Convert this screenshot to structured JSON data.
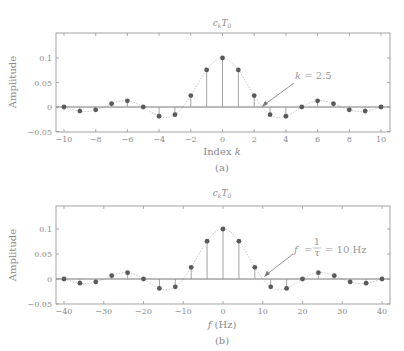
{
  "chart_data": [
    {
      "type": "stem",
      "title": "c_k T_0",
      "xlabel": "Index k",
      "ylabel": "Amplitude",
      "caption": "(a)",
      "xlim": [
        -10.5,
        10.5
      ],
      "ylim": [
        -0.05,
        0.15
      ],
      "xticks": [
        -10,
        -8,
        -6,
        -4,
        -2,
        0,
        2,
        4,
        6,
        8,
        10
      ],
      "xtick_labels": [
        "−10",
        "−8",
        "−6",
        "−4",
        "−2",
        "0",
        "2",
        "4",
        "6",
        "8",
        "10"
      ],
      "yticks": [
        -0.05,
        0,
        0.05,
        0.1
      ],
      "ytick_labels": [
        "−0.05",
        "0",
        "0.05",
        "0.1"
      ],
      "grid": false,
      "x": [
        -10,
        -9,
        -8,
        -7,
        -6,
        -5,
        -4,
        -3,
        -2,
        -1,
        0,
        1,
        2,
        3,
        4,
        5,
        6,
        7,
        8,
        9,
        10
      ],
      "values": [
        0.0,
        -0.0084,
        -0.0058,
        0.0067,
        0.0126,
        0.0,
        -0.0189,
        -0.0156,
        0.0234,
        0.0757,
        0.1,
        0.0757,
        0.0234,
        -0.0156,
        -0.0189,
        0.0,
        0.0126,
        0.0067,
        -0.0058,
        -0.0084,
        0.0
      ],
      "envelope": "0.1·sinc(k/2.5), dotted",
      "annotation": {
        "text": "k = 2.5",
        "x": 2.5,
        "y": 0
      }
    },
    {
      "type": "stem",
      "title": "c_k T_0",
      "xlabel": "f (Hz)",
      "ylabel": "Amplitude",
      "caption": "(b)",
      "xlim": [
        -42,
        42
      ],
      "ylim": [
        -0.05,
        0.15
      ],
      "xticks": [
        -40,
        -30,
        -20,
        -10,
        0,
        10,
        20,
        30,
        40
      ],
      "xtick_labels": [
        "−40",
        "−30",
        "−20",
        "−10",
        "0",
        "10",
        "20",
        "30",
        "40"
      ],
      "yticks": [
        -0.05,
        0,
        0.05,
        0.1
      ],
      "ytick_labels": [
        "−0.05",
        "0",
        "0.05",
        "0.1"
      ],
      "grid": false,
      "x": [
        -40,
        -36,
        -32,
        -28,
        -24,
        -20,
        -16,
        -12,
        -8,
        -4,
        0,
        4,
        8,
        12,
        16,
        20,
        24,
        28,
        32,
        36,
        40
      ],
      "values": [
        0.0,
        -0.0084,
        -0.0058,
        0.0067,
        0.0126,
        0.0,
        -0.0189,
        -0.0156,
        0.0234,
        0.0757,
        0.1,
        0.0757,
        0.0234,
        -0.0156,
        -0.0189,
        0.0,
        0.0126,
        0.0067,
        -0.0058,
        -0.0084,
        0.0
      ],
      "envelope": "0.1·sinc(f/10), dotted",
      "annotation": {
        "text": "f = 1/τ = 10 Hz",
        "x": 10,
        "y": 0
      }
    }
  ],
  "plots": {
    "a": {
      "title_main": "c",
      "title_sub": "k",
      "title_main2": "T",
      "title_sub2": "0",
      "xlabel_text": "Index ",
      "xlabel_var": "k",
      "ylabel": "Amplitude",
      "caption": "(a)",
      "annot_var": "k",
      "annot_rest": " = 2.5"
    },
    "b": {
      "title_main": "c",
      "title_sub": "k",
      "title_main2": "T",
      "title_sub2": "0",
      "xlabel_var": "f",
      "xlabel_text": " (Hz)",
      "ylabel": "Amplitude",
      "caption": "(b)",
      "annot_var": "f",
      "annot_eq": "=",
      "annot_num": "1",
      "annot_den": "τ",
      "annot_rest": "= 10 Hz"
    }
  },
  "colors": {
    "frame": "#8c8c8c",
    "stem": "#9a9a9a",
    "marker": "#5a5a5a",
    "envelope": "#c8c8c8",
    "text": "#8a8a8a"
  }
}
